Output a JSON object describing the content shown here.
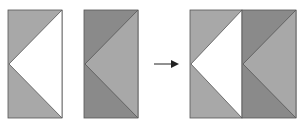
{
  "diagram": {
    "colors": {
      "light_gray": "#a8a8a8",
      "dark_gray": "#8a8a8a",
      "white": "#ffffff",
      "outline": "#555555",
      "arrow": "#222222"
    },
    "panels": [
      {
        "name": "block-a",
        "corners": "light_gray",
        "center_triangle": "white"
      },
      {
        "name": "block-b",
        "corners": "dark_gray",
        "center_triangle": "light_gray"
      },
      {
        "name": "combined-block",
        "parts": [
          "block-a",
          "block-b"
        ]
      }
    ],
    "arrow": {
      "direction": "right"
    }
  }
}
